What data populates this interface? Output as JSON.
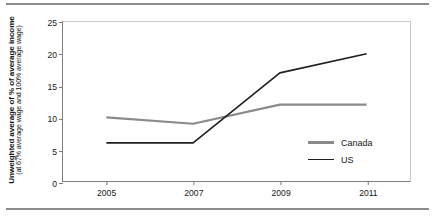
{
  "chart_data": {
    "type": "line",
    "title": "",
    "xlabel": "",
    "ylabel": "Unweighted average of % of average income",
    "ylabel_sub": "(at 67% average wage and 100% average wage)",
    "categories": [
      "2005",
      "2007",
      "2009",
      "2011"
    ],
    "x": [
      2005,
      2007,
      2009,
      2011
    ],
    "xlim": [
      2004,
      2012
    ],
    "ylim": [
      0,
      25
    ],
    "yticks": [
      0,
      5,
      10,
      15,
      20,
      25
    ],
    "ytick_labels": [
      "0",
      "5",
      "10",
      "15",
      "20",
      "25"
    ],
    "xticks": [
      2005,
      2007,
      2009,
      2011
    ],
    "xtick_labels": [
      "2005",
      "2007",
      "2009",
      "2011"
    ],
    "grid": false,
    "legend_position": "inside-lower-right",
    "series": [
      {
        "name": "Canada",
        "color": "#8a8a8a",
        "values": [
          10,
          9,
          12,
          12
        ]
      },
      {
        "name": "US",
        "color": "#1f1f1f",
        "values": [
          6,
          6,
          17,
          20
        ]
      }
    ]
  },
  "legend": {
    "items": [
      {
        "label": "Canada",
        "color": "#8a8a8a"
      },
      {
        "label": "US",
        "color": "#1f1f1f"
      }
    ]
  },
  "colors": {
    "canada": "#8a8a8a",
    "us": "#1f1f1f",
    "rule": "#8c8c8c",
    "axis": "#7d7d7d",
    "frame": "#c9c9c9"
  }
}
